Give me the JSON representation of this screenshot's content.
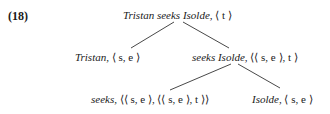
{
  "example_number": "(18)",
  "tree": {
    "root": {
      "expr": "Tristan seeks Isolde,",
      "type": "⟨ t ⟩"
    },
    "left": {
      "expr": "Tristan,",
      "type": "⟨ s, e ⟩"
    },
    "right": {
      "expr": "seeks Isolde,",
      "type": "⟨⟨ s, e ⟩, t ⟩"
    },
    "right_left": {
      "expr": "seeks,",
      "type": "⟨⟨ s, e ⟩, ⟨⟨ s, e ⟩, t ⟩⟩"
    },
    "right_right": {
      "expr": "Isolde,",
      "type": "⟨ s, e ⟩"
    }
  }
}
